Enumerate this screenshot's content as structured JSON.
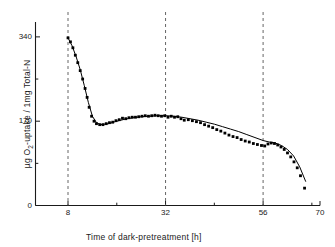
{
  "chart_data": {
    "type": "scatter",
    "title": "",
    "subtitle": "",
    "xlabel": "Time of dark-pretreatment   [h]",
    "ylabel_parts": {
      "prefix": "µg O",
      "sub": "2",
      "suffix": "-uptake / 1mg  Total-N"
    },
    "ylabel": "µg O2-uptake / 1mg Total-N",
    "xlim": [
      0,
      70
    ],
    "ylim": [
      0,
      370
    ],
    "grid": false,
    "legend": null,
    "x_major_ticks": [
      8,
      32,
      56,
      70
    ],
    "x_major_tick_labels": [
      "8",
      "32",
      "56",
      "70"
    ],
    "x_minor_ticks": [
      20,
      44,
      68
    ],
    "y_major_ticks": [
      0,
      170,
      340
    ],
    "y_major_tick_labels": [
      "0",
      "170",
      "340"
    ],
    "y_minor_ticks": [
      85,
      255
    ],
    "dashed_vlines": [
      8,
      32,
      56
    ],
    "series": [
      {
        "name": "O2-uptake measurements",
        "marker": "filled-square",
        "marker_color": "#000000",
        "x": [
          8.0,
          8.6,
          9.2,
          9.8,
          10.4,
          11.0,
          11.6,
          12.2,
          12.7,
          13.2,
          13.8,
          14.4,
          15.0,
          15.8,
          16.6,
          17.4,
          18.2,
          19.0,
          19.8,
          20.6,
          21.4,
          22.2,
          23.0,
          23.8,
          24.6,
          25.4,
          26.2,
          27.0,
          27.8,
          28.6,
          29.4,
          30.2,
          31.0,
          31.8,
          32.6,
          33.4,
          34.2,
          35.0,
          35.8,
          36.6,
          37.6,
          38.6,
          39.6,
          40.6,
          41.6,
          42.6,
          43.6,
          44.6,
          45.6,
          46.6,
          47.6,
          48.6,
          49.6,
          50.6,
          51.6,
          52.6,
          53.6,
          54.6,
          55.6,
          56.4,
          57.2,
          58.0,
          58.8,
          59.6,
          60.4,
          61.2,
          62.0,
          62.8,
          63.6,
          64.4,
          65.2,
          66.2
        ],
        "y": [
          338,
          330,
          318,
          303,
          288,
          272,
          255,
          236,
          218,
          198,
          180,
          170,
          165,
          163,
          163,
          165,
          167,
          168,
          171,
          173,
          176,
          175,
          177,
          178,
          178,
          179,
          180,
          181,
          180,
          181,
          182,
          181,
          180,
          181,
          178,
          180,
          178,
          179,
          175,
          172,
          173,
          171,
          169,
          167,
          163,
          160,
          157,
          153,
          150,
          146,
          142,
          139,
          137,
          133,
          130,
          128,
          125,
          123,
          121,
          120,
          124,
          126,
          125,
          122,
          118,
          113,
          106,
          98,
          88,
          76,
          60,
          35
        ]
      }
    ],
    "fit_curve": {
      "name": "smoothed trend line",
      "color": "#000000",
      "x": [
        8.0,
        9.0,
        10.0,
        11.0,
        12.0,
        13.0,
        14.0,
        15.0,
        16.0,
        18.0,
        20.0,
        22.0,
        24.0,
        26.0,
        28.0,
        30.0,
        32.0,
        34.0,
        36.0,
        38.0,
        40.0,
        42.0,
        44.0,
        46.0,
        48.0,
        50.0,
        52.0,
        54.0,
        56.0,
        57.5,
        59.0,
        60.5,
        62.0,
        63.5,
        65.0,
        66.5
      ],
      "y": [
        338,
        322,
        300,
        274,
        242,
        208,
        180,
        167,
        163,
        165,
        170,
        174,
        177,
        179,
        180,
        181,
        181,
        180,
        178,
        175,
        172,
        168,
        164,
        159,
        154,
        149,
        143,
        137,
        131,
        128,
        126,
        121,
        113,
        100,
        78,
        48
      ]
    }
  },
  "axes": {
    "y_tick_0": "0",
    "y_tick_170": "170",
    "y_tick_340": "340",
    "x_tick_8": "8",
    "x_tick_32": "32",
    "x_tick_56": "56",
    "x_tick_70": "70"
  }
}
